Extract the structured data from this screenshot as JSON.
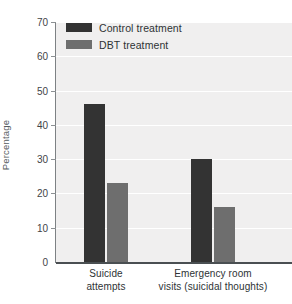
{
  "chart_data": {
    "type": "bar",
    "title": "",
    "subtitle": "",
    "xlabel": "",
    "ylabel": "Percentage",
    "ylim": [
      0,
      70
    ],
    "ytick_labels": [
      "70",
      "60",
      "50",
      "40",
      "30",
      "20",
      "10",
      "0"
    ],
    "yticks": [
      70,
      60,
      50,
      40,
      30,
      20,
      10,
      0
    ],
    "grid": true,
    "legend_position": "top-left",
    "categories": [
      "Suicide attempts",
      "Emergency room visits (suicidal thoughts)"
    ],
    "category_lines": [
      [
        "Suicide",
        "attempts"
      ],
      [
        "Emergency room",
        "visits (suicidal thoughts)"
      ]
    ],
    "series": [
      {
        "name": "Control treatment",
        "color": "#333333",
        "values": [
          46,
          30
        ]
      },
      {
        "name": "DBT treatment",
        "color": "#6e6e6e",
        "values": [
          23,
          16
        ]
      }
    ]
  },
  "legend": {
    "items": [
      {
        "label": "Control treatment",
        "color": "#333333"
      },
      {
        "label": "DBT treatment",
        "color": "#6e6e6e"
      }
    ]
  },
  "colors": {
    "control": "#333333",
    "dbt": "#6e6e6e",
    "plot_background": "#f0efef",
    "gridline": "#ffffff",
    "axis": "#4a4f52",
    "tick_text": "#3f4447"
  }
}
